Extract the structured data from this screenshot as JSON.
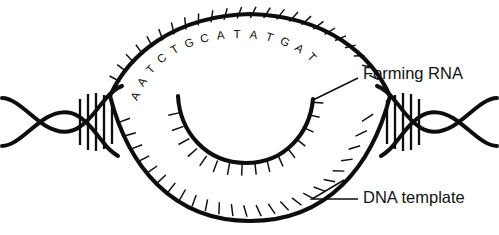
{
  "figure": {
    "background_color": "#ffffff",
    "ink_color": "#0d0d0d"
  },
  "labels": {
    "forming_rna": "Forming RNA",
    "dna_template": "DNA template"
  },
  "base_sequence": {
    "description": "Bases written along the inside of the upper DNA strand of the transcription bubble, read left to right",
    "letters": [
      "A",
      "A",
      "T",
      "C",
      "T",
      "G",
      "C",
      "A",
      "T",
      "A",
      "T",
      "G",
      "A",
      "T"
    ]
  },
  "structure": {
    "left_helix_rungs": 5,
    "right_helix_rungs": 5,
    "upper_strand_ticks": 22,
    "lower_strand_ticks": 22,
    "rna_strand_ticks": 17
  },
  "geometry": {
    "canvas_width": 499,
    "canvas_height": 235,
    "left_crossing": [
      118,
      105
    ],
    "right_crossing": [
      383,
      105
    ],
    "bubble_top": [
      250,
      14
    ],
    "bubble_bottom": [
      250,
      221
    ],
    "rna_left_end": [
      178,
      96
    ],
    "rna_right_end": [
      313,
      99
    ],
    "rna_bottom": [
      246,
      163
    ]
  },
  "callouts": {
    "forming_rna_text_pos": [
      361,
      75
    ],
    "forming_rna_leader_from": [
      357,
      78
    ],
    "forming_rna_leader_to": [
      313,
      100
    ],
    "dna_template_text_pos": [
      361,
      199
    ],
    "dna_template_leader_from": [
      357,
      199
    ],
    "dna_template_leader_to": [
      312,
      199
    ]
  }
}
